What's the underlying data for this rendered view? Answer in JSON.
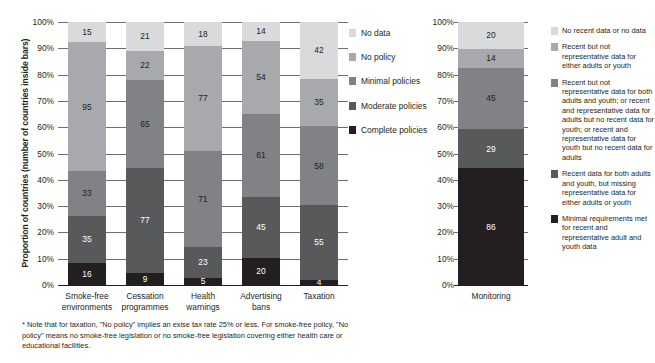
{
  "colors": {
    "no_data": "#d9dadb",
    "no_policy": "#a7a9ac",
    "minimal": "#808285",
    "moderate": "#58595b",
    "complete": "#231f20",
    "gridline": "#6d6e71",
    "axis": "#231f20",
    "text": "#231f20",
    "background": "#ffffff"
  },
  "chart_data": [
    {
      "type": "bar",
      "id": "policy-chart",
      "stacked": true,
      "stack_mode": "percent",
      "title": "",
      "xlabel": "",
      "ylabel": "Proportion of countries (number of countries inside bars)",
      "ylim": [
        0,
        100
      ],
      "ytick_labels": [
        "100%",
        "90%",
        "80%",
        "70%",
        "60%",
        "50%",
        "40%",
        "30%",
        "20%",
        "10%",
        "0%"
      ],
      "ytick_values": [
        100,
        90,
        80,
        70,
        60,
        50,
        40,
        30,
        20,
        10,
        0
      ],
      "grid": true,
      "legend_position": "right",
      "categories": [
        "Smoke-free environments",
        "Cessation programmes",
        "Health warnings",
        "Advertising bans",
        "Taxation"
      ],
      "category_lines": [
        [
          "Smoke-free",
          "environments"
        ],
        [
          "Cessation",
          "programmes"
        ],
        [
          "Health",
          "warnings"
        ],
        [
          "Advertising",
          "bans"
        ],
        [
          "Taxation"
        ]
      ],
      "series": [
        {
          "name": "Complete policies",
          "key": "complete",
          "values": [
            16,
            9,
            5,
            20,
            4
          ]
        },
        {
          "name": "Moderate policies",
          "key": "moderate",
          "values": [
            35,
            77,
            23,
            45,
            55
          ]
        },
        {
          "name": "Minimal policies",
          "key": "minimal",
          "values": [
            33,
            65,
            71,
            61,
            58
          ]
        },
        {
          "name": "No policy",
          "key": "no_policy",
          "values": [
            95,
            22,
            77,
            54,
            35
          ]
        },
        {
          "name": "No data",
          "key": "no_data",
          "values": [
            15,
            21,
            18,
            14,
            42
          ]
        }
      ],
      "legend": [
        {
          "label": "No data",
          "key": "no_data"
        },
        {
          "label": "No policy",
          "key": "no_policy"
        },
        {
          "label": "Minimal policies",
          "key": "minimal"
        },
        {
          "label": "Moderate policies",
          "key": "moderate"
        },
        {
          "label": "Complete policies",
          "key": "complete"
        }
      ]
    },
    {
      "type": "bar",
      "id": "monitoring-chart",
      "stacked": true,
      "stack_mode": "percent",
      "title": "",
      "xlabel": "",
      "ylabel": "",
      "ylim": [
        0,
        100
      ],
      "ytick_labels": [
        "100%",
        "90%",
        "80%",
        "70%",
        "60%",
        "50%",
        "40%",
        "30%",
        "20%",
        "10%",
        "0%"
      ],
      "ytick_values": [
        100,
        90,
        80,
        70,
        60,
        50,
        40,
        30,
        20,
        10,
        0
      ],
      "grid": true,
      "legend_position": "right",
      "categories": [
        "Monitoring"
      ],
      "category_lines": [
        [
          "Monitoring"
        ]
      ],
      "series": [
        {
          "name": "Minimal requirements met for recent and representative adult and youth data",
          "key": "complete",
          "values": [
            86
          ]
        },
        {
          "name": "Recent data for both adults and youth, but missing representative data for either adults or youth",
          "key": "moderate",
          "values": [
            29
          ]
        },
        {
          "name": "Recent but not representative data for both adults and youth; or recent and representative data for adults but no recent data for youth; or recent and representative data for youth but no recent data for adults",
          "key": "minimal",
          "values": [
            45
          ]
        },
        {
          "name": "Recent but not representative data for either adults or youth",
          "key": "no_policy",
          "values": [
            14
          ]
        },
        {
          "name": "No recent data or no data",
          "key": "no_data",
          "values": [
            20
          ]
        }
      ],
      "legend": [
        {
          "label": "No recent data or no data",
          "key": "no_data"
        },
        {
          "label": "Recent but not representative data for either adults or youth",
          "key": "no_policy"
        },
        {
          "label": "Recent but not representative data for both adults and youth; or recent and representative data for adults but no recent data for youth; or recent and representative data for youth but no recent data for adults",
          "key": "minimal"
        },
        {
          "label": "Recent data for both adults and youth, but missing representative data for either adults or youth",
          "key": "moderate"
        },
        {
          "label": "Minimal requirements met for recent and representative adult and youth data",
          "key": "complete"
        }
      ]
    }
  ],
  "footnote": "* Note that for taxation, \"No policy\" implies an exise tax rate 25% or less. For smoke-free policy, \"No policy\" means no smoke-free legislation or no smoke-free legislation covering either health care or educational facilities."
}
